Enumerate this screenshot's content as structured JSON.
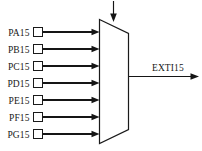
{
  "diagram": {
    "type": "multiplexer-block-diagram",
    "colors": {
      "line": "#151515",
      "text": "#171717",
      "background": "#ffffff",
      "box_fill": "#ffffff"
    },
    "inputs": [
      {
        "label": "PA15",
        "y": 32
      },
      {
        "label": "PB15",
        "y": 49
      },
      {
        "label": "PC15",
        "y": 66
      },
      {
        "label": "PD15",
        "y": 83
      },
      {
        "label": "PE15",
        "y": 100
      },
      {
        "label": "PF15",
        "y": 117
      },
      {
        "label": "PG15",
        "y": 134
      }
    ],
    "output": {
      "label": "EXTI15"
    },
    "control": {
      "label": ""
    }
  }
}
